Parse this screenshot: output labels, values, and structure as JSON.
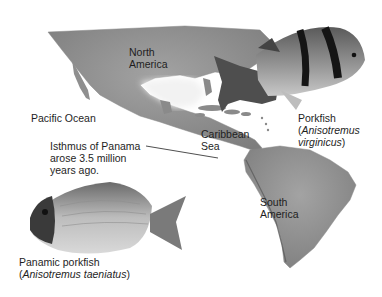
{
  "figure": {
    "map_labels": {
      "north_america": [
        "North",
        "America"
      ],
      "pacific_ocean": "Pacific Ocean",
      "caribbean_sea": [
        "Caribbean",
        "Sea"
      ],
      "south_america": [
        "South",
        "America"
      ]
    },
    "isthmus_annotation": [
      "Isthmus of Panama",
      "arose 3.5 million",
      "years ago."
    ],
    "fish": [
      {
        "common_name": "Porkfish",
        "scientific_name_line1": "Anisotremus",
        "scientific_name_line2": "virginicus"
      },
      {
        "common_name": "Panamic porkfish",
        "scientific_name": "Anisotremus taeniatus"
      }
    ],
    "colors": {
      "land": "#9a9a9a",
      "land_dark": "#6e6e6e",
      "sea": "#ffffff",
      "fish_body": "#8a8a8a",
      "fish_stripe": "#1a1a1a"
    }
  }
}
